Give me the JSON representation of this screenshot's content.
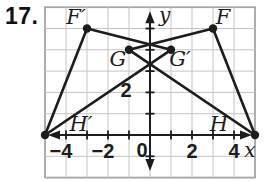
{
  "problem_number": "17.",
  "figure": {
    "canvas": {
      "width": 264,
      "height": 181
    },
    "colors": {
      "ink": "#1c1c1c",
      "grid": "#c4c4c4",
      "frame": "#a5a5a5",
      "background": "#ffffff"
    },
    "plane": {
      "x_min": -5,
      "x_max": 5,
      "y_min": -2,
      "y_max": 6,
      "origin_px": {
        "x": 150,
        "y": 135
      },
      "px_per_unit": {
        "x": 21.0,
        "y": 21.3
      }
    },
    "axes": {
      "x_label": "x",
      "y_label": "y",
      "origin_label": "0",
      "x_ticks": [
        -4,
        -3,
        -2,
        -1,
        1,
        2,
        3,
        4
      ],
      "y_ticks": [
        -1,
        1,
        2,
        3,
        4,
        5
      ],
      "x_tick_labels": [
        {
          "value": -4,
          "text": "−4"
        },
        {
          "value": -2,
          "text": "−2"
        },
        {
          "value": 2,
          "text": "2"
        },
        {
          "value": 4,
          "text": "4"
        }
      ],
      "y_tick_labels": [
        {
          "value": 2,
          "text": "2"
        }
      ]
    },
    "triangles": [
      {
        "name": "FGH",
        "vertices": [
          {
            "label": "F",
            "x": 3,
            "y": 5,
            "label_offset": {
              "dx": 10,
              "dy": -4.5
            }
          },
          {
            "label": "G",
            "x": -1,
            "y": 4,
            "label_offset": {
              "dx": -11,
              "dy": 16
            }
          },
          {
            "label": "H",
            "x": 5,
            "y": 0,
            "label_offset": {
              "dx": -36,
              "dy": -4
            }
          }
        ]
      },
      {
        "name": "F'G'H'",
        "vertices": [
          {
            "label": "F′",
            "x": -3,
            "y": 5,
            "label_offset": {
              "dx": -11,
              "dy": -4.5
            }
          },
          {
            "label": "G′",
            "x": 1,
            "y": 4,
            "label_offset": {
              "dx": 9,
              "dy": 16
            }
          },
          {
            "label": "H′",
            "x": -5,
            "y": 0,
            "label_offset": {
              "dx": 36,
              "dy": -4
            }
          }
        ]
      }
    ]
  }
}
